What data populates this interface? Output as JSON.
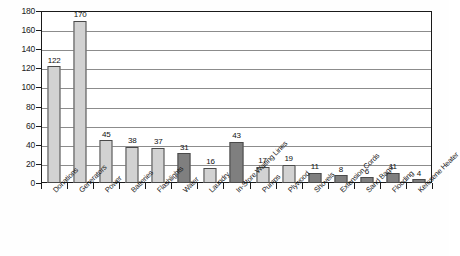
{
  "chart_data": {
    "type": "bar",
    "title": "",
    "subtitle": "",
    "xlabel": "",
    "ylabel": "",
    "ylim": [
      0,
      180
    ],
    "ytick_step": 20,
    "yticks": [
      0,
      20,
      40,
      60,
      80,
      100,
      120,
      140,
      160,
      180
    ],
    "grid": true,
    "legend": "none",
    "categories": [
      "Donations",
      "Generators",
      "Power",
      "Batteries",
      "Flashlights",
      "Water",
      "Laundry",
      "In-Store Waiting Lines",
      "Pumps",
      "Plywood",
      "Shovels",
      "Extension Cords",
      "Sand Bags",
      "Flooding",
      "Kerosene Heater"
    ],
    "values": [
      122,
      170,
      45,
      38,
      37,
      31,
      16,
      43,
      17,
      19,
      11,
      8,
      6,
      11,
      4
    ],
    "bar_shades": [
      "light",
      "light",
      "light",
      "light",
      "light",
      "dark",
      "light",
      "dark",
      "light",
      "light",
      "dark",
      "dark",
      "dark",
      "dark",
      "dark"
    ],
    "colors": {
      "bar_light": "#d2d2d2",
      "bar_dark": "#7f7f7f",
      "bar_border": "#4a4a4a",
      "gridline": "#8c8c8c",
      "axis": "#1a1a1a",
      "plot_background": "#ffffff",
      "page_background": "#fefefe",
      "label_text": "#1a1a1a"
    }
  }
}
